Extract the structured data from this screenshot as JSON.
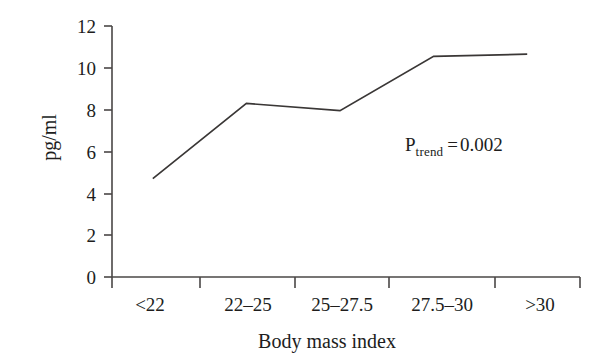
{
  "chart_data": {
    "type": "line",
    "title": "",
    "subtitle": "",
    "xlabel": "Body mass index",
    "ylabel": "pg/ml",
    "categories": [
      "<22",
      "22–25",
      "25–27.5",
      "27.5–30",
      ">30"
    ],
    "values": [
      4.7,
      8.3,
      7.95,
      10.55,
      10.65
    ],
    "series": [
      {
        "name": "pg/ml",
        "values": [
          4.7,
          8.3,
          7.95,
          10.55,
          10.65
        ]
      }
    ],
    "ylim": [
      0,
      12
    ],
    "y_ticks": [
      0,
      2,
      4,
      6,
      8,
      10,
      12
    ],
    "y_tick_labels": [
      "0",
      "2",
      "4",
      "6",
      "8",
      "10",
      "12"
    ],
    "grid": false,
    "legend": false,
    "legend_position": "none",
    "line_color": "#3a3736",
    "background_color": "#ffffff",
    "annotations": [
      {
        "name": "p-trend",
        "prefix": "P",
        "subscript": "trend",
        "equals": "=",
        "value": "0.002",
        "full_text": "P_trend = 0.002"
      }
    ]
  }
}
